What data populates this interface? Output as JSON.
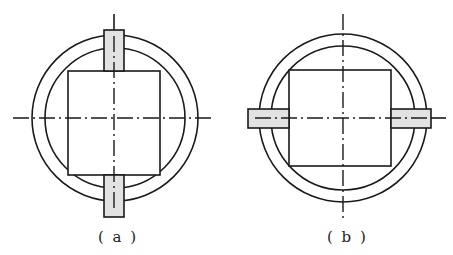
{
  "figures": [
    {
      "id": "a",
      "caption": "( a )",
      "center": [
        115,
        118
      ],
      "outer_radius": 83,
      "inner_radius": 70,
      "square": {
        "x": 68,
        "y": 71,
        "w": 92,
        "h": 104
      },
      "slot_orientation": "vertical",
      "slots": [
        {
          "x": 104,
          "y": 30,
          "w": 20,
          "h": 41
        },
        {
          "x": 104,
          "y": 175,
          "w": 20,
          "h": 42
        }
      ]
    },
    {
      "id": "b",
      "caption": "( b )",
      "center": [
        343,
        118
      ],
      "outer_radius": 84,
      "inner_radius": 72,
      "square": {
        "x": 289,
        "y": 70,
        "w": 102,
        "h": 96
      },
      "slot_orientation": "horizontal",
      "slots": [
        {
          "x": 248,
          "y": 109,
          "w": 41,
          "h": 19
        },
        {
          "x": 391,
          "y": 109,
          "w": 40,
          "h": 19
        }
      ]
    }
  ],
  "colors": {
    "line": "#1a1a1a",
    "slot_fill": "#e2e2e2",
    "background": "#ffffff"
  }
}
